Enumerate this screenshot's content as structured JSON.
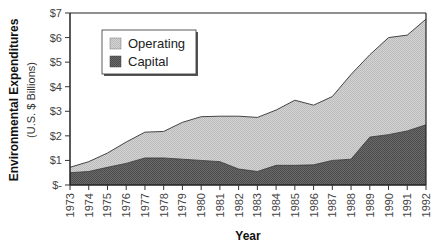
{
  "chart_data": {
    "type": "area",
    "stacked": true,
    "title": "",
    "xlabel": "Year",
    "ylabel": "Environmental Expenditures",
    "ylabel_sub": "(U.S. $ Billions)",
    "ylim": [
      0,
      7
    ],
    "y_ticks": [
      0,
      1,
      2,
      3,
      4,
      5,
      6,
      7
    ],
    "y_tick_labels": [
      "$-",
      "$1",
      "$2",
      "$3",
      "$4",
      "$5",
      "$6",
      "$7"
    ],
    "x": [
      "1973",
      "1974",
      "1975",
      "1976",
      "1977",
      "1978",
      "1979",
      "1980",
      "1981",
      "1982",
      "1983",
      "1984",
      "1985",
      "1986",
      "1987",
      "1988",
      "1989",
      "1990",
      "1991",
      "1992"
    ],
    "series": [
      {
        "name": "Capital",
        "color": "#5a5a5a",
        "values": [
          0.5,
          0.55,
          0.72,
          0.88,
          1.1,
          1.1,
          1.05,
          1.0,
          0.95,
          0.65,
          0.55,
          0.8,
          0.8,
          0.82,
          1.0,
          1.05,
          1.95,
          2.05,
          2.2,
          2.45
        ]
      },
      {
        "name": "Operating",
        "color": "#c8c8c8",
        "values": [
          0.22,
          0.4,
          0.58,
          0.87,
          1.05,
          1.08,
          1.5,
          1.78,
          1.85,
          2.15,
          2.2,
          2.25,
          2.65,
          2.43,
          2.6,
          3.45,
          3.35,
          3.95,
          3.9,
          4.3
        ]
      }
    ],
    "legend": [
      "Operating",
      "Capital"
    ],
    "legend_position": "top-left",
    "grid": false
  }
}
